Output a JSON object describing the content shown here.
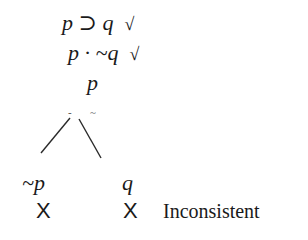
{
  "tree": {
    "premises": [
      {
        "formula": "p ⊃ q",
        "check": "√"
      },
      {
        "formula": "p · ~q",
        "check": "√"
      },
      {
        "formula": "p",
        "check": ""
      }
    ],
    "branch_marks": {
      "left": "-",
      "right": "~"
    },
    "branches": [
      {
        "formula": "~p",
        "closed_mark": "X"
      },
      {
        "formula": "q",
        "closed_mark": "X"
      }
    ],
    "verdict": "Inconsistent"
  }
}
